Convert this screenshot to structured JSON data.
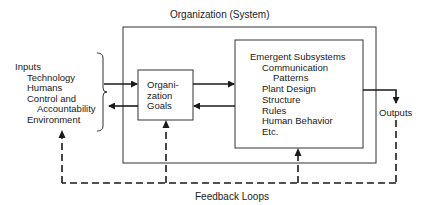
{
  "diagram": {
    "system_title": "Organization (System)",
    "inputs": {
      "heading": "Inputs",
      "items": [
        "Technology",
        "Humans",
        "Control and",
        "Accountability",
        "Environment"
      ]
    },
    "goals_box": {
      "lines": [
        "Organi-",
        "zation",
        "Goals"
      ]
    },
    "subsystems_box": {
      "heading": "Emergent Subsystems",
      "items": [
        "Communication",
        "Patterns",
        "Plant Design",
        "Structure",
        "Rules",
        "Human Behavior",
        "Etc."
      ]
    },
    "outputs_label": "Outputs",
    "feedback_label": "Feedback Loops",
    "colors": {
      "line": "#1a1a1a",
      "background": "#ffffff"
    }
  }
}
